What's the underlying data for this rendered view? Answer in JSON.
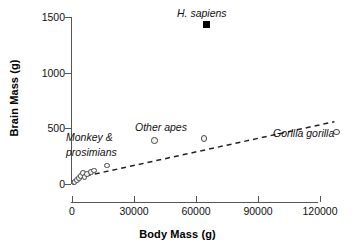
{
  "chart_data": {
    "type": "scatter",
    "title": "",
    "xlabel": "Body Mass (g)",
    "ylabel": "Brain Mass (g)",
    "xlim": [
      0,
      135000
    ],
    "ylim": [
      0,
      1500
    ],
    "xticks": [
      0,
      30000,
      60000,
      90000,
      120000
    ],
    "xticklabels": [
      "0",
      "30000",
      "60000",
      "90000",
      "120000"
    ],
    "yticks": [
      0,
      500,
      1000,
      1500
    ],
    "yticklabels": [
      "0",
      "500",
      "1000",
      "1500"
    ],
    "grid": false,
    "legend": "none",
    "series": [
      {
        "name": "Monkey & prosimians",
        "marker": "open-circle",
        "points": [
          {
            "x": 700,
            "y": 12
          },
          {
            "x": 1200,
            "y": 20
          },
          {
            "x": 2300,
            "y": 38
          },
          {
            "x": 3300,
            "y": 55
          },
          {
            "x": 4200,
            "y": 72
          },
          {
            "x": 5200,
            "y": 98
          },
          {
            "x": 6100,
            "y": 62
          },
          {
            "x": 7400,
            "y": 88
          },
          {
            "x": 9300,
            "y": 108
          },
          {
            "x": 10600,
            "y": 120
          },
          {
            "x": 16800,
            "y": 165
          }
        ]
      },
      {
        "name": "Other apes",
        "marker": "open-circle",
        "points": [
          {
            "x": 40000,
            "y": 390
          },
          {
            "x": 64000,
            "y": 410
          }
        ]
      },
      {
        "name": "Gorilla gorilla",
        "marker": "open-circle",
        "points": [
          {
            "x": 128000,
            "y": 465
          }
        ]
      },
      {
        "name": "H. sapiens",
        "marker": "filled-square",
        "points": [
          {
            "x": 65000,
            "y": 1430
          }
        ]
      }
    ],
    "trendline": {
      "style": "dashed",
      "x0": 2500,
      "y0": 55,
      "x1": 127000,
      "y1": 560
    },
    "annotations": [
      {
        "name": "h-sapiens-label",
        "text": "H. sapiens",
        "italic": true
      },
      {
        "name": "other-apes-label",
        "text": "Other apes",
        "italic": true
      },
      {
        "name": "gorilla-label",
        "text": "Gorilla gorilla",
        "italic": true
      },
      {
        "name": "monkey-label-line1",
        "text": "Monkey &",
        "italic": true
      },
      {
        "name": "monkey-label-line2",
        "text": "prosimians",
        "italic": true
      }
    ],
    "colors": {
      "marker_edge": "#4a4a4a",
      "marker_face": "#f2f2f2",
      "filled_marker": "#000000",
      "axis": "#555555",
      "text": "#111111",
      "trendline": "#222222"
    }
  }
}
